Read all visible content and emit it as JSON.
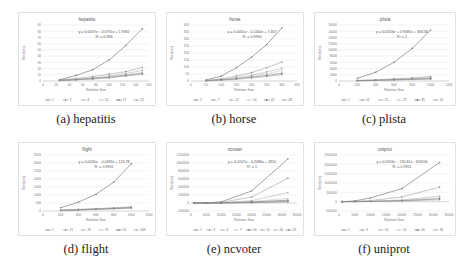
{
  "figure": {
    "panels": [
      {
        "id": "a",
        "caption": "(a) hepatitis"
      },
      {
        "id": "b",
        "caption": "(b) horse"
      },
      {
        "id": "c",
        "caption": "(c) plista"
      },
      {
        "id": "d",
        "caption": "(d) flight"
      },
      {
        "id": "e",
        "caption": "(e) ncvoter"
      },
      {
        "id": "f",
        "caption": "(f) uniprot"
      }
    ]
  },
  "chart_data": [
    {
      "type": "line",
      "title": "hepatitis",
      "xlabel": "Relation Size",
      "ylabel": "Time(ms)",
      "xlim": [
        0,
        160
      ],
      "ylim": [
        0,
        90
      ],
      "xticks": [
        0,
        20,
        40,
        60,
        80,
        100,
        120,
        140,
        160
      ],
      "yticks": [
        0,
        10,
        20,
        30,
        40,
        50,
        60,
        70,
        80,
        90
      ],
      "trendline": {
        "equation": "y = 0.0037x² - 0.0751x + 1.9482",
        "r2": "R² = 0.996"
      },
      "x": [
        25,
        50,
        75,
        100,
        125,
        150
      ],
      "series": [
        {
          "name": "1",
          "values": [
            2,
            9,
            18,
            34,
            57,
            84
          ]
        },
        {
          "name": "2",
          "values": [
            2,
            4,
            7,
            11,
            15,
            22
          ]
        },
        {
          "name": "4",
          "values": [
            1,
            3,
            5,
            8,
            12,
            17
          ]
        },
        {
          "name": "11",
          "values": [
            1,
            2,
            4,
            7,
            10,
            14
          ]
        },
        {
          "name": "17",
          "values": [
            1,
            2,
            4,
            6,
            9,
            12
          ]
        },
        {
          "name": "22",
          "values": [
            1,
            2,
            3,
            5,
            8,
            11
          ]
        }
      ],
      "grid": true,
      "legend_position": "bottom"
    },
    {
      "type": "line",
      "title": "horse",
      "xlabel": "Relation Size",
      "ylabel": "Time(ms)",
      "xlim": [
        0,
        350
      ],
      "ylim": [
        0,
        400
      ],
      "xticks": [
        0,
        50,
        100,
        150,
        200,
        250,
        300,
        350
      ],
      "yticks": [
        0,
        50,
        100,
        150,
        200,
        250,
        300,
        350,
        400
      ],
      "trendline": {
        "equation": "y = 0.0051x² - 0.1562x + 7.357",
        "r2": "R² = 0.9994"
      },
      "x": [
        50,
        100,
        150,
        200,
        250,
        300
      ],
      "series": [
        {
          "name": "1",
          "values": [
            8,
            35,
            95,
            170,
            260,
            380
          ]
        },
        {
          "name": "7",
          "values": [
            5,
            15,
            35,
            60,
            95,
            135
          ]
        },
        {
          "name": "12",
          "values": [
            4,
            12,
            25,
            42,
            65,
            90
          ]
        },
        {
          "name": "14",
          "values": [
            3,
            10,
            20,
            35,
            52,
            75
          ]
        },
        {
          "name": "22",
          "values": [
            2,
            8,
            16,
            28,
            40,
            55
          ]
        },
        {
          "name": "28",
          "values": [
            2,
            6,
            12,
            22,
            32,
            45
          ]
        }
      ],
      "grid": true,
      "legend_position": "bottom"
    },
    {
      "type": "line",
      "title": "plista",
      "xlabel": "Relation Size",
      "ylabel": "Time(ms)",
      "xlim": [
        0,
        1200
      ],
      "ylim": [
        0,
        18000
      ],
      "xticks": [
        0,
        200,
        400,
        600,
        800,
        1000,
        1200
      ],
      "yticks": [
        0,
        2000,
        4000,
        6000,
        8000,
        10000,
        12000,
        14000,
        16000,
        18000
      ],
      "trendline": {
        "equation": "y = 0.0153x² + 0.9081x + 303.36",
        "r2": "R² = 1"
      },
      "x": [
        200,
        400,
        600,
        800,
        1000
      ],
      "series": [
        {
          "name": "1",
          "values": [
            900,
            2800,
            6000,
            10500,
            16400
          ]
        },
        {
          "name": "11",
          "values": [
            200,
            400,
            700,
            1000,
            1400
          ]
        },
        {
          "name": "21",
          "values": [
            150,
            300,
            550,
            800,
            1100
          ]
        },
        {
          "name": "27",
          "values": [
            120,
            250,
            450,
            650,
            900
          ]
        },
        {
          "name": "35",
          "values": [
            100,
            200,
            380,
            550,
            750
          ]
        },
        {
          "name": "41",
          "values": [
            80,
            170,
            300,
            450,
            600
          ]
        }
      ],
      "grid": true,
      "legend_position": "bottom"
    },
    {
      "type": "line",
      "title": "flight",
      "xlabel": "Relation Size",
      "ylabel": "Time(ms)",
      "xlim": [
        0,
        1200
      ],
      "ylim": [
        0,
        3500
      ],
      "xticks": [
        0,
        200,
        400,
        600,
        800,
        1000,
        1200
      ],
      "yticks": [
        0,
        500,
        1000,
        1500,
        2000,
        2500,
        3000,
        3500
      ],
      "trendline": {
        "equation": "y = 0.0026x² - 0.0333x + 123.78",
        "r2": "R² = 0.9931"
      },
      "x": [
        200,
        400,
        600,
        800,
        1000
      ],
      "series": [
        {
          "name": "1",
          "values": [
            200,
            550,
            1050,
            1800,
            2950
          ]
        },
        {
          "name": "11",
          "values": [
            60,
            100,
            150,
            200,
            260
          ]
        },
        {
          "name": "19",
          "values": [
            50,
            90,
            130,
            180,
            230
          ]
        },
        {
          "name": "37",
          "values": [
            40,
            80,
            120,
            160,
            210
          ]
        },
        {
          "name": "55",
          "values": [
            35,
            70,
            110,
            150,
            200
          ]
        },
        {
          "name": "109",
          "values": [
            30,
            60,
            100,
            140,
            180
          ]
        }
      ],
      "grid": true,
      "legend_position": "bottom"
    },
    {
      "type": "line",
      "title": "ncvoter",
      "xlabel": "Relation Size",
      "ylabel": "Time(ms)",
      "xlim": [
        0,
        35000
      ],
      "ylim": [
        -200000,
        1200000
      ],
      "xticks": [
        0,
        5000,
        10000,
        15000,
        20000,
        25000,
        30000,
        35000
      ],
      "yticks": [
        -200000,
        0,
        200000,
        400000,
        600000,
        800000,
        1000000,
        1200000
      ],
      "trendline": {
        "equation": "y = 0.0107x² - 0.2086x + 2810",
        "r2": "R² = 1"
      },
      "x": [
        1000,
        5000,
        10000,
        20000,
        32000
      ],
      "series": [
        {
          "name": "1",
          "values": [
            0,
            2000,
            30000,
            300000,
            1100000
          ]
        },
        {
          "name": "3",
          "values": [
            0,
            1000,
            15000,
            150000,
            620000
          ]
        },
        {
          "name": "4",
          "values": [
            0,
            500,
            8000,
            60000,
            260000
          ]
        },
        {
          "name": "7",
          "values": [
            0,
            300,
            5000,
            40000,
            110000
          ]
        },
        {
          "name": "10",
          "values": [
            0,
            200,
            3000,
            25000,
            70000
          ]
        },
        {
          "name": "15",
          "values": [
            0,
            150,
            2000,
            18000,
            50000
          ]
        },
        {
          "name": "20",
          "values": [
            0,
            100,
            1500,
            12000,
            40000
          ]
        },
        {
          "name": "25",
          "values": [
            0,
            80,
            1000,
            9000,
            30000
          ]
        }
      ],
      "grid": true,
      "legend_position": "bottom"
    },
    {
      "type": "line",
      "title": "uniprot",
      "xlabel": "Relation Size",
      "ylabel": "Time(ms)",
      "xlim": [
        0,
        35000
      ],
      "ylim": [
        -500000,
        2500000
      ],
      "xticks": [
        0,
        5000,
        10000,
        15000,
        20000,
        25000,
        30000,
        35000
      ],
      "yticks": [
        -500000,
        0,
        500000,
        1000000,
        1500000,
        2000000,
        2500000
      ],
      "trendline": {
        "equation": "y = 0.0194x² - 130.82x - 409106",
        "r2": "R² = 0.9951"
      },
      "x": [
        1000,
        5000,
        10000,
        20000,
        32000
      ],
      "series": [
        {
          "name": "1",
          "values": [
            0,
            40000,
            200000,
            700000,
            2100000
          ]
        },
        {
          "name": "3",
          "values": [
            0,
            15000,
            60000,
            250000,
            780000
          ]
        },
        {
          "name": "10",
          "values": [
            0,
            5000,
            25000,
            90000,
            300000
          ]
        },
        {
          "name": "15",
          "values": [
            0,
            4000,
            18000,
            70000,
            220000
          ]
        },
        {
          "name": "20",
          "values": [
            0,
            3000,
            12000,
            50000,
            150000
          ]
        },
        {
          "name": "30",
          "values": [
            0,
            2000,
            8000,
            35000,
            100000
          ]
        }
      ],
      "grid": true,
      "legend_position": "bottom"
    }
  ]
}
